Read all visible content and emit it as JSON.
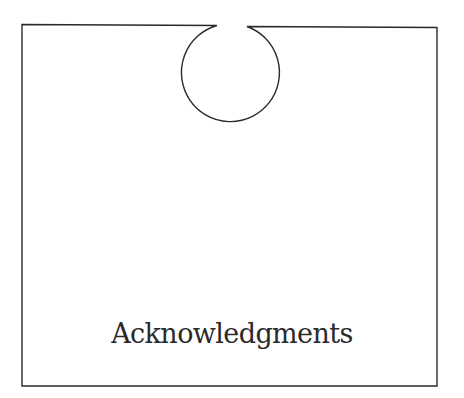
{
  "page": {
    "title": "Acknowledgments"
  },
  "colors": {
    "ink": "#2a2a2a",
    "background": "#ffffff"
  }
}
